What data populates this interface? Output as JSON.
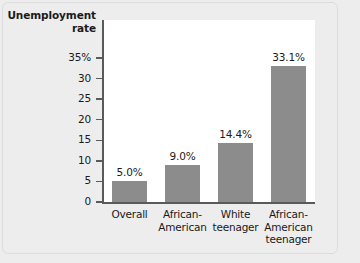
{
  "chart_data": {
    "type": "bar",
    "title": "",
    "ylabel": "Unemployment rate",
    "xlabel": "",
    "categories": [
      "Overall",
      "African-\nAmerican",
      "White\nteenager",
      "African-\nAmerican\nteenager"
    ],
    "values": [
      5.0,
      9.0,
      14.4,
      33.1
    ],
    "value_labels": [
      "5.0%",
      "9.0%",
      "14.4%",
      "33.1%"
    ],
    "ylim": [
      0,
      35
    ],
    "yticks": [
      0,
      5,
      10,
      15,
      20,
      25,
      30,
      35
    ],
    "ytick_labels": [
      "0",
      "5",
      "10",
      "15",
      "20",
      "25",
      "30",
      "35%"
    ],
    "grid": false,
    "legend": null,
    "bar_color": "#8c8c8c",
    "plot_background": "#ffffff",
    "figure_background": "#ededed",
    "axis_color": "#5a5a5a"
  }
}
